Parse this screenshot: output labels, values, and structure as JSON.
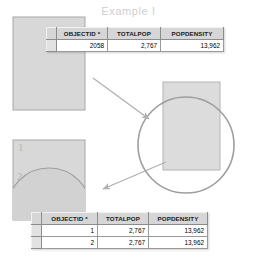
{
  "title": "Example I",
  "colors": {
    "title": "#cfcfcf",
    "polygon_fill": "#d8d8d8",
    "polygon_stroke": "#a8a8a8",
    "circle_stroke": "#9e9e9e",
    "arrow": "#b0b0b0",
    "table_header_bg": "#d6d6d6",
    "table_border": "#9a9a9a",
    "label": "#b4b4b4"
  },
  "columns": {
    "objectid": "OBJECTID *",
    "totalpop": "TOTALPOP",
    "popdensity": "POPDENSITY"
  },
  "table_one": {
    "name": "input-feature-attribute-table",
    "rows": [
      {
        "objectid": "2058",
        "totalpop": "2,767",
        "popdensity": "13,962"
      }
    ]
  },
  "table_two": {
    "name": "output-feature-attribute-table",
    "rows": [
      {
        "objectid": "1",
        "totalpop": "2,767",
        "popdensity": "13,962"
      },
      {
        "objectid": "2",
        "totalpop": "2,767",
        "popdensity": "13,962"
      }
    ]
  },
  "polygons": {
    "input_label": "",
    "output_part_one": "1",
    "output_part_two": "2"
  },
  "shapes": {
    "input_rectangle": {
      "x": 13,
      "y": 17,
      "width": 72,
      "height": 93
    },
    "overlay_rectangle": {
      "x": 163,
      "y": 82,
      "width": 57,
      "height": 88
    },
    "overlay_circle": {
      "cx": 186,
      "cy": 145,
      "r": 48
    },
    "output_rectangle": {
      "x": 13,
      "y": 140,
      "width": 72,
      "height": 80
    }
  },
  "arrows": [
    {
      "name": "arrow-input-to-overlay",
      "x1": 93,
      "y1": 78,
      "x2": 151,
      "y2": 121
    },
    {
      "name": "arrow-overlay-to-output",
      "x1": 166,
      "y1": 162,
      "x2": 100,
      "y2": 190
    }
  ]
}
